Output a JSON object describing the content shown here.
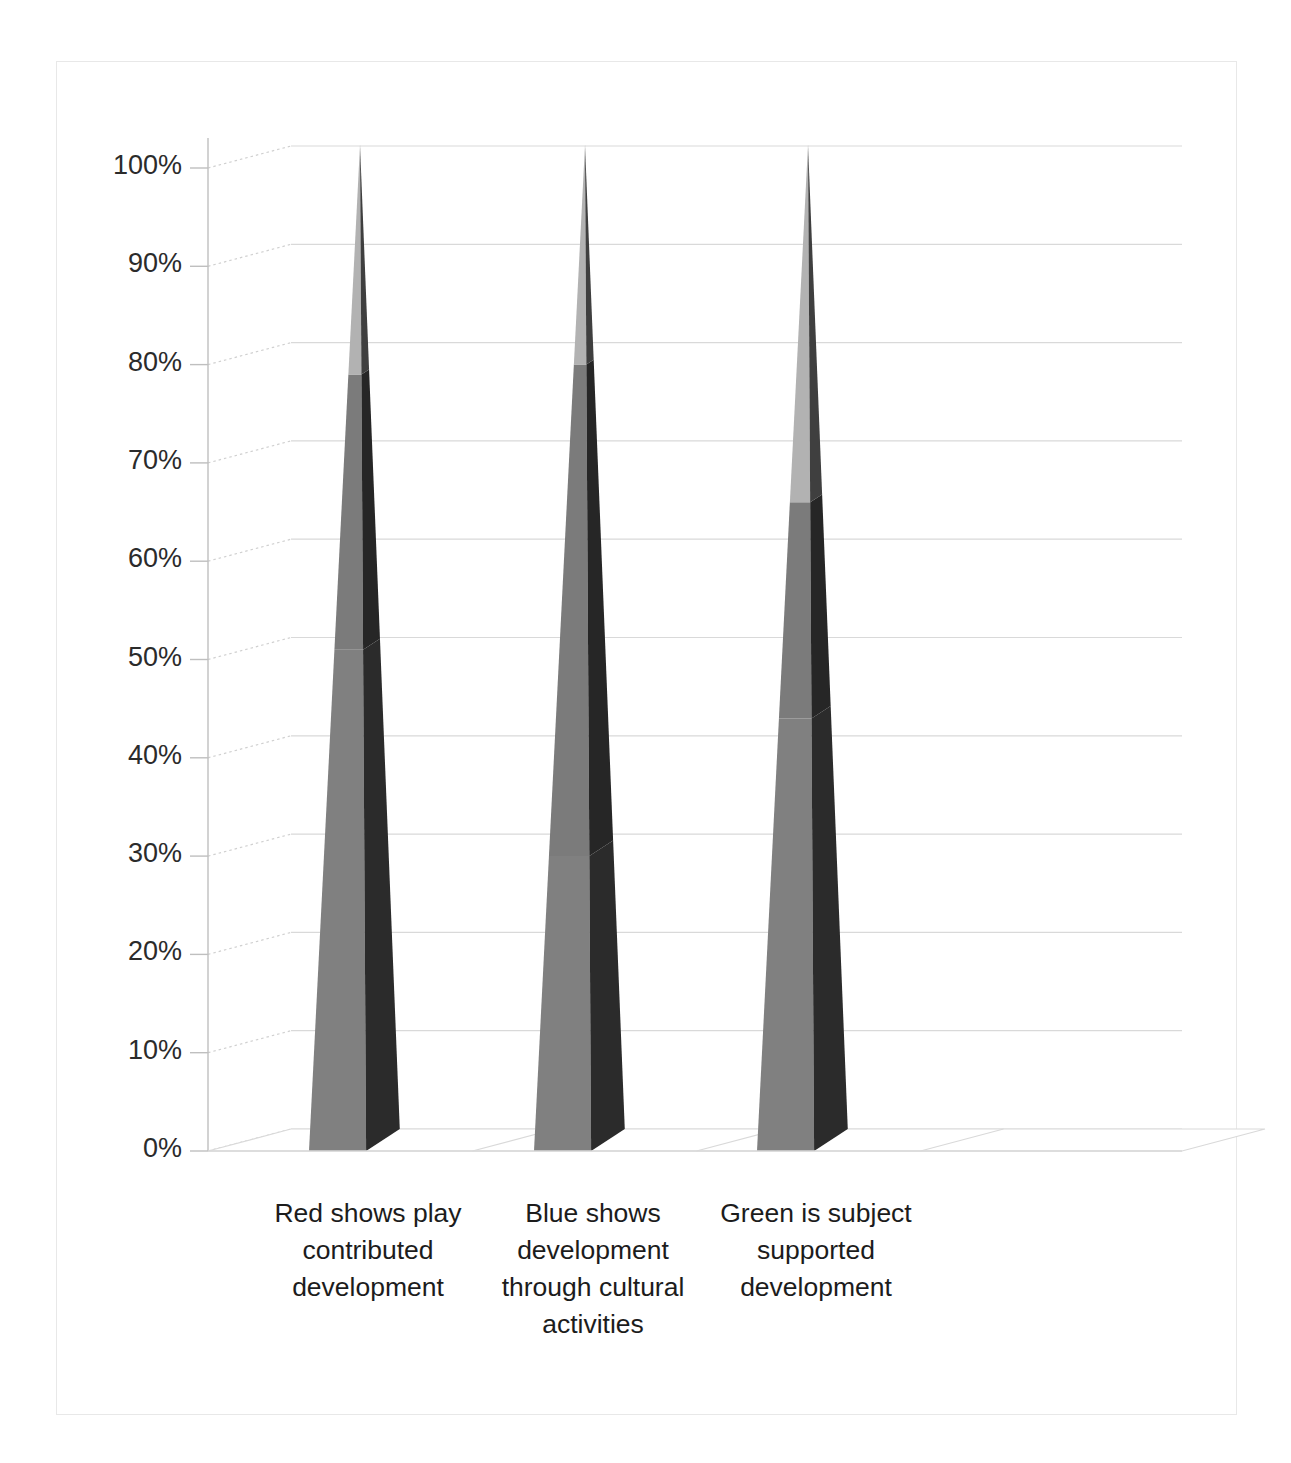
{
  "chart_data": {
    "type": "bar",
    "subtype": "3d-stacked-pyramid",
    "title": "",
    "subtitle": "",
    "xlabel": "",
    "ylabel": "",
    "ylim": [
      0,
      100
    ],
    "y_unit": "%",
    "grid": true,
    "legend": "none",
    "categories": [
      "Red shows play contributed development",
      "Blue shows development through cultural activities",
      "Green is subject supported development"
    ],
    "category_lines": [
      [
        "Red shows play",
        "contributed",
        "development"
      ],
      [
        "Blue shows",
        "development",
        "through cultural",
        "activities"
      ],
      [
        "Green is subject",
        "supported",
        "development"
      ]
    ],
    "y_ticks": [
      "0%",
      "10%",
      "20%",
      "30%",
      "40%",
      "50%",
      "60%",
      "70%",
      "80%",
      "90%",
      "100%"
    ],
    "y_tick_values": [
      0,
      10,
      20,
      30,
      40,
      50,
      60,
      70,
      80,
      90,
      100
    ],
    "series": [
      {
        "name": "bottom-segment",
        "values": [
          51,
          30,
          44
        ]
      },
      {
        "name": "middle-segment",
        "values": [
          28,
          50,
          22
        ]
      },
      {
        "name": "top-segment",
        "values": [
          21,
          20,
          34
        ]
      }
    ],
    "stack_boundaries": [
      [
        51,
        79
      ],
      [
        30,
        80
      ],
      [
        44,
        66
      ]
    ],
    "annotations": []
  },
  "colors": {
    "segment_bottom_front": "#808080",
    "segment_middle_front": "#7b7b7b",
    "segment_top_front": "#b2b2b2",
    "segment_bottom_side": "#2b2b2b",
    "segment_middle_side": "#262626",
    "segment_top_side": "#3f3f3f",
    "gridline": "#d9d9d9",
    "axis_line": "#bfbfbf",
    "frame_border": "#e8e8e8",
    "depth_line": "#d0d0d0",
    "floor_line": "#d9d9d9",
    "tick_text": "#2b2b2b",
    "category_text": "#1c1c1c",
    "background": "#ffffff"
  },
  "axis": {
    "y_title": "",
    "x_title": ""
  }
}
